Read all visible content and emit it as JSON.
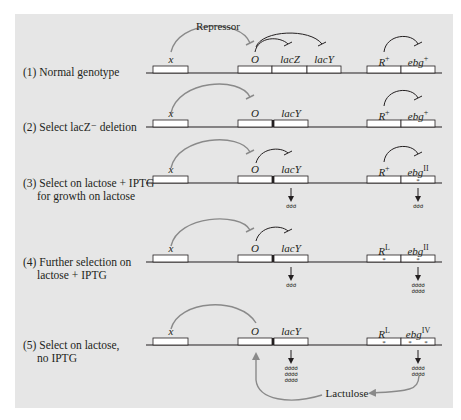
{
  "figure": {
    "colors": {
      "panel_bg": "#e6e6e6",
      "line": "#231f20",
      "box_fill": "#ffffff",
      "arc_gray": "#8a8a8a",
      "arc_dark": "#231f20",
      "feedback_arrow": "#8a8a8a"
    },
    "repressor_label": "Repressor",
    "lactulose_label": "Lactulose",
    "rows": [
      {
        "label_line1": "(1) Normal genotype",
        "label_line2": "",
        "genes": {
          "x": "x",
          "o": "O",
          "lacz": "lacZ",
          "lacy": "lacY",
          "r": "R",
          "r_sup": "+",
          "ebg": "ebg",
          "ebg_sup": "+"
        }
      },
      {
        "label_line1": "(2) Select lacZ⁻ deletion",
        "label_line2": "",
        "genes": {
          "x": "x",
          "o": "O",
          "lacy": "lacY",
          "r": "R",
          "r_sup": "+",
          "ebg": "ebg",
          "ebg_sup": "+"
        }
      },
      {
        "label_line1": "(3) Select on lactose + IPTG",
        "label_line2": "for growth on lactose",
        "genes": {
          "x": "x",
          "o": "O",
          "lacy": "lacY",
          "r": "R",
          "r_sup": "+",
          "ebg": "ebg",
          "ebg_sup": "II"
        },
        "mrna_lacy": "σσσ",
        "mrna_ebg": "σσσ"
      },
      {
        "label_line1": "(4) Further selection on",
        "label_line2": "lactose + IPTG",
        "genes": {
          "x": "x",
          "o": "O",
          "lacy": "lacY",
          "r": "R",
          "r_sup": "L",
          "ebg": "ebg",
          "ebg_sup": "II"
        },
        "mrna_lacy": "σσσ",
        "mrna_ebg": "σσσσ\nσσσσ"
      },
      {
        "label_line1": "(5) Select on lactose,",
        "label_line2": "no IPTG",
        "genes": {
          "x": "x",
          "o": "O",
          "lacy": "lacY",
          "r": "R",
          "r_sup": "L",
          "ebg": "ebg",
          "ebg_sup": "IV"
        },
        "mrna_lacy": "σσσσ\nσσσσ\nσσσσ",
        "mrna_ebg": "σσσσ\nσσσσ"
      }
    ],
    "mutation_marker": "*"
  }
}
